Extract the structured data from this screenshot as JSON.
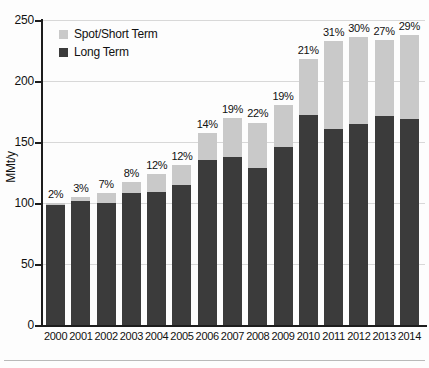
{
  "chart_data": {
    "type": "bar",
    "subtype": "stacked-bar",
    "title": "",
    "xlabel": "",
    "ylabel": "MMt/y",
    "ylim": [
      0,
      250
    ],
    "yticks": [
      0,
      50,
      100,
      150,
      200,
      250
    ],
    "grid": true,
    "legend_position": "top-left",
    "categories": [
      "2000",
      "2001",
      "2002",
      "2003",
      "2004",
      "2005",
      "2006",
      "2007",
      "2008",
      "2009",
      "2010",
      "2011",
      "2012",
      "2013",
      "2014"
    ],
    "series": [
      {
        "name": "Long Term",
        "color": "#3b3b3b",
        "values": [
          98,
          102,
          100,
          108,
          109,
          115,
          135,
          138,
          129,
          146,
          172,
          161,
          165,
          171,
          169
        ]
      },
      {
        "name": "Spot/Short Term",
        "color": "#c9c9c9",
        "values": [
          2,
          3,
          8,
          9,
          15,
          16,
          22,
          32,
          37,
          34,
          46,
          72,
          71,
          63,
          69
        ]
      }
    ],
    "totals": [
      100,
      105,
      108,
      117,
      124,
      131,
      157,
      170,
      166,
      180,
      218,
      233,
      236,
      234,
      238
    ],
    "annotations": {
      "description": "Percent share of Spot/Short Term shown above each bar",
      "labels": [
        "2%",
        "3%",
        "7%",
        "8%",
        "12%",
        "12%",
        "14%",
        "19%",
        "22%",
        "19%",
        "21%",
        "31%",
        "30%",
        "27%",
        "29%"
      ]
    }
  },
  "axes": {
    "y_title": "MMt/y",
    "y_tick_labels": [
      "250",
      "200",
      "150",
      "100",
      "50",
      "0"
    ],
    "x_tick_labels": [
      "2000",
      "2001",
      "2002",
      "2003",
      "2004",
      "2005",
      "2006",
      "2007",
      "2008",
      "2009",
      "2010",
      "2011",
      "2012",
      "2013",
      "2014"
    ]
  },
  "legend": {
    "items": [
      {
        "label": "Spot/Short Term",
        "color": "#c9c9c9"
      },
      {
        "label": "Long Term",
        "color": "#3b3b3b"
      }
    ]
  },
  "colors": {
    "long_term": "#3b3b3b",
    "spot_short_term": "#c9c9c9",
    "axis": "#1d1d1d",
    "gridline": "#d8d8d8",
    "background": "#fdfdfd"
  }
}
